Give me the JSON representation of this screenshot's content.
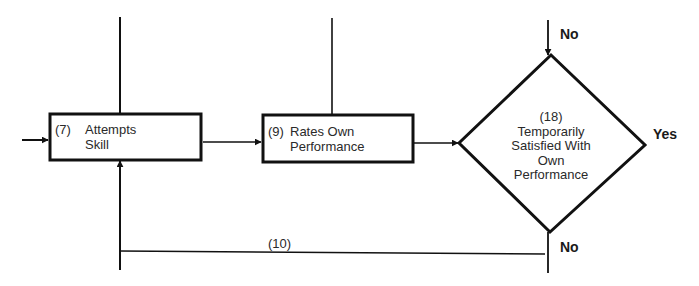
{
  "diagram": {
    "type": "flowchart",
    "stroke_color": "#111111",
    "nodes": [
      {
        "id": "7",
        "shape": "rectangle",
        "number": "(7)",
        "line1": "Attempts",
        "line2": "Skill"
      },
      {
        "id": "9",
        "shape": "rectangle",
        "number": "(9)",
        "line1": "Rates Own",
        "line2": "Performance"
      },
      {
        "id": "18",
        "shape": "diamond",
        "number": "(18)",
        "lines": [
          "Temporarily",
          "Satisfied With",
          "Own",
          "Performance"
        ]
      }
    ],
    "edges": [
      {
        "from": "external-left",
        "to": "7"
      },
      {
        "from": "external-top",
        "to": "7",
        "note": "line from top"
      },
      {
        "from": "7",
        "to": "9"
      },
      {
        "from": "external-top",
        "to": "9",
        "note": "line from top"
      },
      {
        "from": "9",
        "to": "18"
      },
      {
        "from": "external-top",
        "to": "18",
        "label": "No"
      },
      {
        "from": "18",
        "to": "external-right",
        "label": "Yes"
      },
      {
        "from": "18",
        "to": "7",
        "label": "(10)",
        "branch_label": "No",
        "note": "feedback loop along bottom"
      }
    ],
    "labels": {
      "top_no": "No",
      "yes": "Yes",
      "bottom_no": "No",
      "loop": "(10)"
    }
  }
}
